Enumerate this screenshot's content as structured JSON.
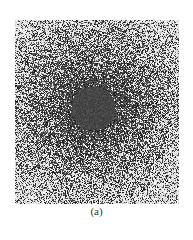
{
  "figure": {
    "caption": "(a)",
    "colors": {
      "background": "#ffffff",
      "dot": "#1a1a1a",
      "center_disk": "#4a4a4a"
    },
    "center": [
      78,
      88
    ],
    "disk_radius": 22
  }
}
